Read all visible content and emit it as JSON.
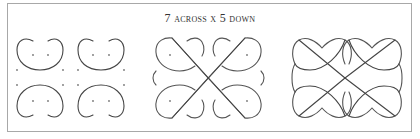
{
  "figure": {
    "title": "7 across x 5 down",
    "panels": [
      {
        "name": "panel-1-dot-grid-arcs",
        "description": "Four separate heart/mushroom arcs around a dot grid"
      },
      {
        "name": "panel-2-partial-kolam",
        "description": "Arcs joined by diagonal crossing lines with side brackets"
      },
      {
        "name": "panel-3-complete-kolam",
        "description": "Completed interlaced kolam pattern"
      }
    ],
    "colors": {
      "border": "#a8a8a8",
      "line": "#555555",
      "dot": "#777777",
      "background": "#ffffff"
    }
  }
}
